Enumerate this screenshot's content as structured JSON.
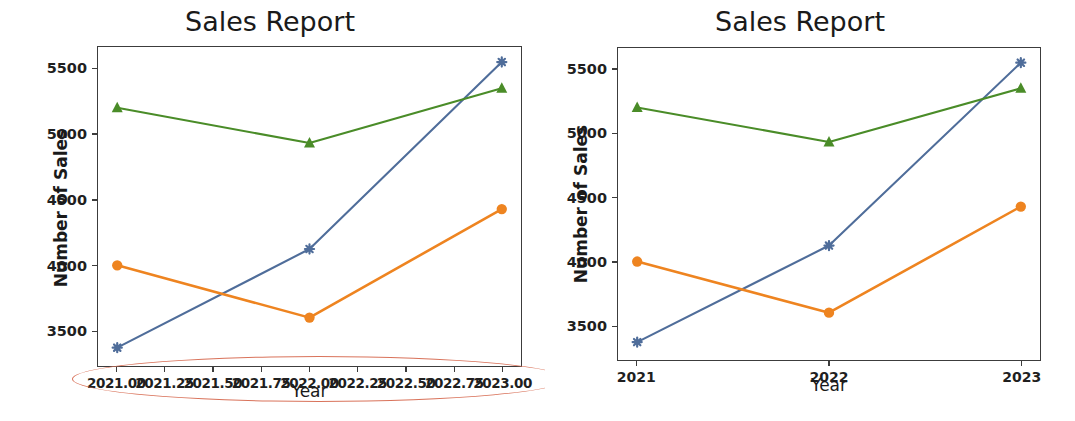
{
  "chart_data": [
    {
      "id": "left",
      "type": "line",
      "title": "Sales Report",
      "xlabel": "Year",
      "ylabel": "Number of Sales",
      "x": [
        2021,
        2022,
        2023
      ],
      "xtick_labels": [
        "2021.00",
        "2021.25",
        "2021.50",
        "2021.75",
        "2022.00",
        "2022.25",
        "2022.50",
        "2022.75",
        "2023.00"
      ],
      "xtick_values": [
        2021.0,
        2021.25,
        2021.5,
        2021.75,
        2022.0,
        2022.25,
        2022.5,
        2022.75,
        2023.0
      ],
      "ytick_labels": [
        "3500",
        "4000",
        "4500",
        "5000",
        "5500"
      ],
      "ytick_values": [
        3500,
        4000,
        4500,
        5000,
        5500
      ],
      "xlim": [
        2020.9,
        2023.1
      ],
      "ylim": [
        3230,
        5670
      ],
      "grid": false,
      "legend": "none",
      "series": [
        {
          "name": "series-1",
          "color": "#4f6d9a",
          "marker": "plus",
          "values": [
            3370,
            4125,
            5555
          ]
        },
        {
          "name": "series-2",
          "color": "#ee8420",
          "marker": "circle",
          "values": [
            4000,
            3600,
            4430
          ]
        },
        {
          "name": "series-3",
          "color": "#4a8c28",
          "marker": "triangle",
          "values": [
            5205,
            4935,
            5355
          ]
        }
      ],
      "annotation": {
        "type": "ellipse",
        "color": "#d9735b",
        "target": "crowded overlapping x-axis tick labels"
      }
    },
    {
      "id": "right",
      "type": "line",
      "title": "Sales Report",
      "xlabel": "Year",
      "ylabel": "Number of Sales",
      "x": [
        2021,
        2022,
        2023
      ],
      "xtick_labels": [
        "2021",
        "2022",
        "2023"
      ],
      "xtick_values": [
        2021,
        2022,
        2023
      ],
      "ytick_labels": [
        "3500",
        "4000",
        "4500",
        "5000",
        "5500"
      ],
      "ytick_values": [
        3500,
        4000,
        4500,
        5000,
        5500
      ],
      "xlim": [
        2020.9,
        2023.1
      ],
      "ylim": [
        3230,
        5670
      ],
      "grid": false,
      "legend": "none",
      "series": [
        {
          "name": "series-1",
          "color": "#4f6d9a",
          "marker": "plus",
          "values": [
            3370,
            4125,
            5555
          ]
        },
        {
          "name": "series-2",
          "color": "#ee8420",
          "marker": "circle",
          "values": [
            4000,
            3600,
            4430
          ]
        },
        {
          "name": "series-3",
          "color": "#4a8c28",
          "marker": "triangle",
          "values": [
            5205,
            4935,
            5355
          ]
        }
      ],
      "annotation": null
    }
  ],
  "left_panel": {
    "title": "Sales Report",
    "xlabel": "Year",
    "ylabel": "Number of Sales"
  },
  "right_panel": {
    "title": "Sales Report",
    "xlabel": "Year",
    "ylabel": "Number of Sales"
  },
  "colors": {
    "series_1": "#4f6d9a",
    "series_2": "#ee8420",
    "series_3": "#4a8c28",
    "annotation": "#d9735b",
    "axis": "#3c3c3c",
    "text": "#1a1a1a",
    "background": "#ffffff"
  }
}
